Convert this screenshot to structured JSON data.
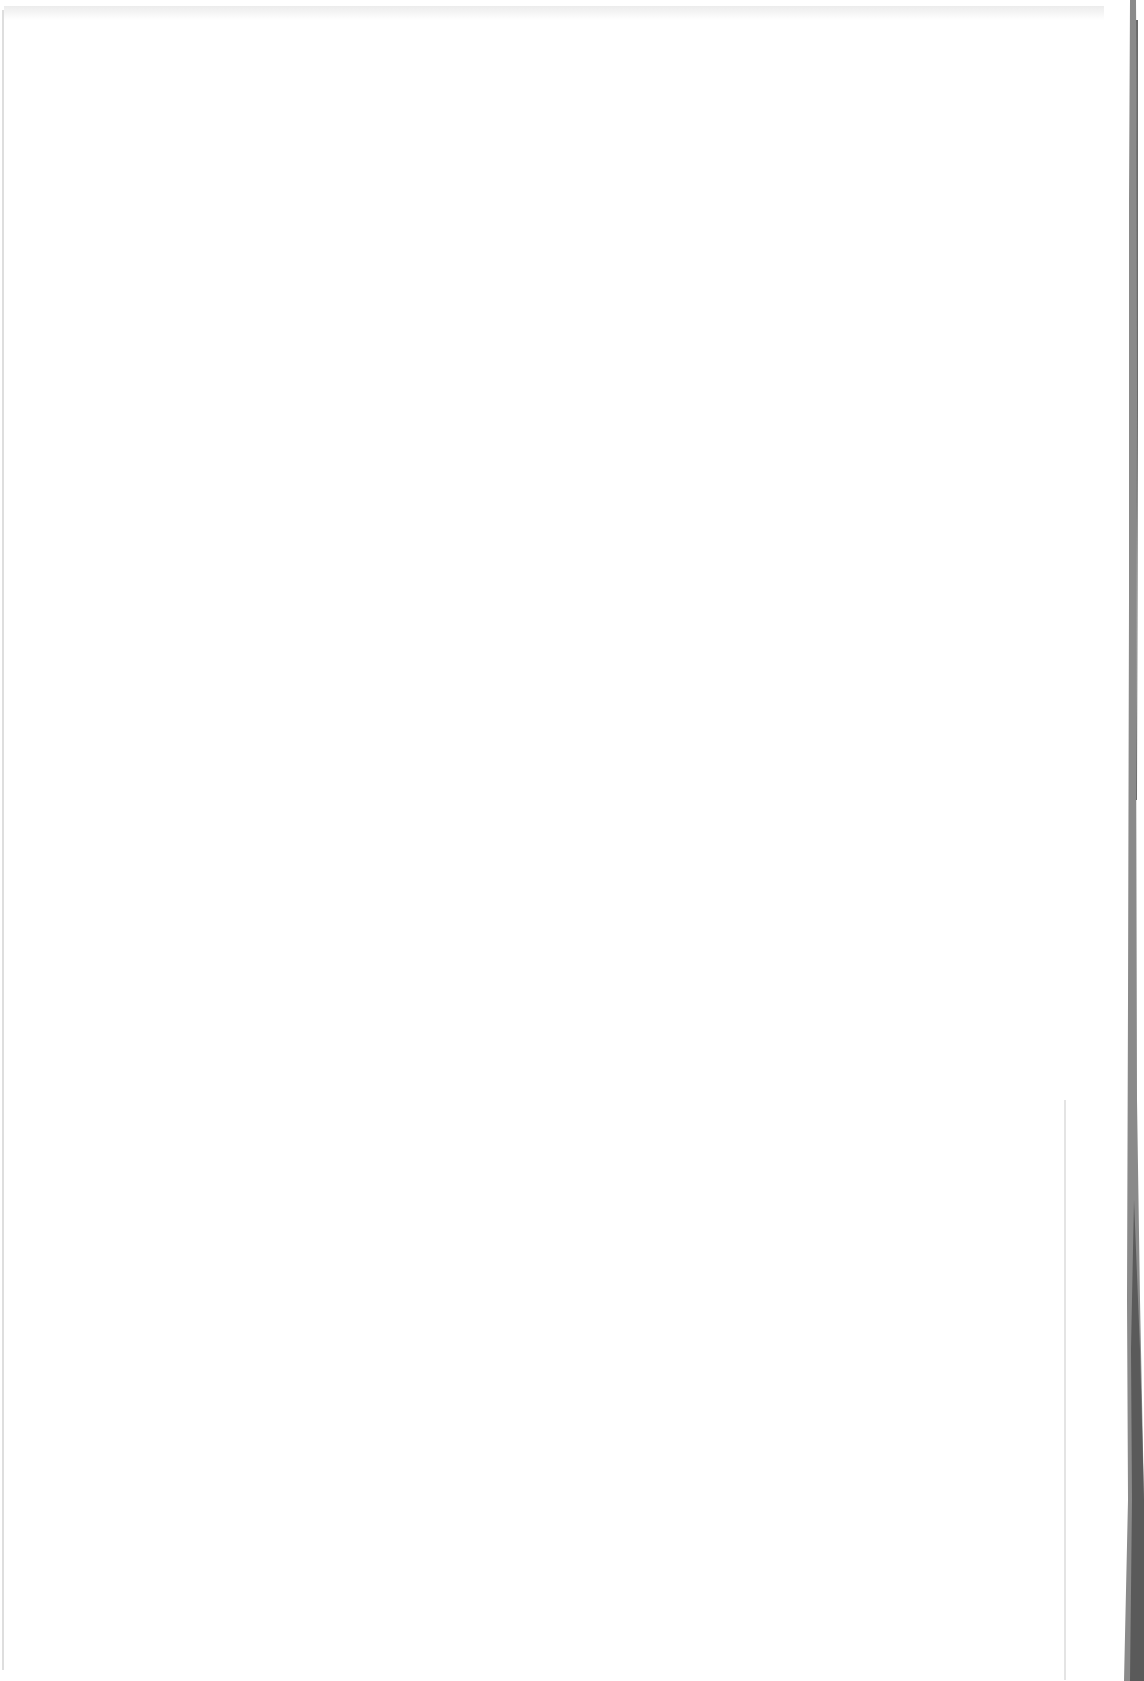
{
  "document": {
    "type": "scanned-page",
    "content": "",
    "colors": {
      "paper": "#ffffff",
      "edge": "#7a7a7a",
      "edge_dark": "#4a4a4a"
    }
  }
}
